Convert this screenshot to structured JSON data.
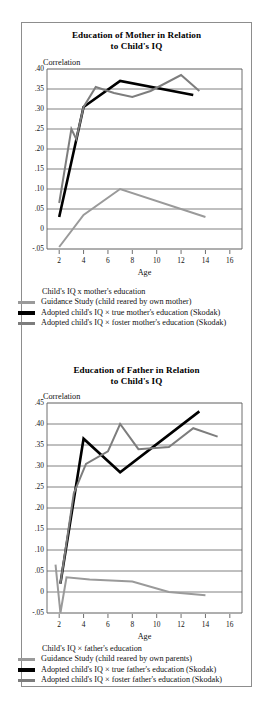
{
  "figure": {
    "panels": [
      {
        "id": "mother",
        "title_line1": "Education of Mother in Relation",
        "title_line2": "to Child's IQ",
        "y_axis_label": "Correlation",
        "x_axis_label": "Age",
        "legend_heading": "Child's IQ x mother's education",
        "legend": [
          {
            "label": "Guidance Study (child reared by own mother)",
            "color": "#9a9a9a",
            "weight": "thin"
          },
          {
            "label": "Adopted child's IQ ×  true mother's education (Skodak)",
            "color": "#000000",
            "weight": "thick"
          },
          {
            "label": "Adopted child's IQ ×  foster mother's education (Skodak)",
            "color": "#7d7d7d",
            "weight": "thin"
          }
        ]
      },
      {
        "id": "father",
        "title_line1": "Education of Father in Relation",
        "title_line2": "to Child's IQ",
        "y_axis_label": "Correlation",
        "x_axis_label": "Age",
        "legend_heading": "Child's IQ ×  father's education",
        "legend": [
          {
            "label": "Guidance Study (child reared by own parents)",
            "color": "#9a9a9a",
            "weight": "thin"
          },
          {
            "label": "Adopted child's IQ ×  true father's education (Skodak)",
            "color": "#000000",
            "weight": "thick"
          },
          {
            "label": "Adopted child's IQ ×  foster father's education (Skodak)",
            "color": "#7d7d7d",
            "weight": "thin"
          }
        ]
      }
    ]
  },
  "chart_data": [
    {
      "type": "line",
      "title": "Education of Mother in Relation to Child's IQ",
      "xlabel": "Age",
      "ylabel": "Correlation",
      "xlim": [
        1,
        17
      ],
      "ylim": [
        -0.05,
        0.4
      ],
      "xticks": [
        2,
        4,
        6,
        8,
        10,
        12,
        14,
        16
      ],
      "yticks": [
        -0.05,
        0,
        0.05,
        0.1,
        0.15,
        0.2,
        0.25,
        0.3,
        0.35,
        0.4
      ],
      "yticklabels": [
        "-.05",
        "0",
        ".05",
        ".10",
        ".15",
        ".20",
        ".25",
        ".30",
        ".35",
        ".40"
      ],
      "grid": true,
      "legend_position": "below",
      "series": [
        {
          "name": "Guidance Study (child reared by own mother)",
          "color": "#9a9a9a",
          "width": 2.0,
          "x": [
            2,
            4,
            7,
            14
          ],
          "y": [
            -0.045,
            0.035,
            0.1,
            0.03
          ]
        },
        {
          "name": "Adopted child's IQ × true mother's education (Skodak)",
          "color": "#000000",
          "width": 2.6,
          "x": [
            2,
            4,
            7,
            13
          ],
          "y": [
            0.03,
            0.305,
            0.37,
            0.335
          ]
        },
        {
          "name": "Adopted child's IQ × foster mother's education (Skodak)",
          "color": "#7d7d7d",
          "width": 2.0,
          "x": [
            2,
            3,
            3.4,
            4,
            5,
            6.5,
            8,
            9.5,
            12,
            13.5
          ],
          "y": [
            0.065,
            0.25,
            0.225,
            0.305,
            0.355,
            0.34,
            0.33,
            0.345,
            0.385,
            0.345
          ]
        }
      ]
    },
    {
      "type": "line",
      "title": "Education of Father in Relation to Child's IQ",
      "xlabel": "Age",
      "ylabel": "Correlation",
      "xlim": [
        1,
        17
      ],
      "ylim": [
        -0.05,
        0.45
      ],
      "xticks": [
        2,
        4,
        6,
        8,
        10,
        12,
        14,
        16
      ],
      "yticks": [
        -0.05,
        0,
        0.05,
        0.1,
        0.15,
        0.2,
        0.25,
        0.3,
        0.35,
        0.4,
        0.45
      ],
      "yticklabels": [
        "-.05",
        "0",
        ".05",
        ".10",
        ".15",
        ".20",
        ".25",
        ".30",
        ".35",
        ".40",
        ".45"
      ],
      "grid": true,
      "legend_position": "below",
      "series": [
        {
          "name": "Guidance Study (child reared by own parents)",
          "color": "#9a9a9a",
          "width": 2.0,
          "x": [
            1.7,
            2.1,
            2.6,
            4.5,
            8,
            11,
            14
          ],
          "y": [
            0.065,
            -0.05,
            0.035,
            0.03,
            0.025,
            0.0,
            -0.008
          ]
        },
        {
          "name": "Adopted child's IQ × true father's education (Skodak)",
          "color": "#000000",
          "width": 2.6,
          "x": [
            2.1,
            4,
            7,
            13.5
          ],
          "y": [
            0.02,
            0.365,
            0.285,
            0.43
          ]
        },
        {
          "name": "Adopted child's IQ × foster father's education (Skodak)",
          "color": "#7d7d7d",
          "width": 2.0,
          "x": [
            2.1,
            3.2,
            4.2,
            6,
            7,
            8.5,
            11,
            13,
            15
          ],
          "y": [
            0.02,
            0.235,
            0.305,
            0.335,
            0.4,
            0.34,
            0.345,
            0.39,
            0.37
          ]
        }
      ]
    }
  ]
}
